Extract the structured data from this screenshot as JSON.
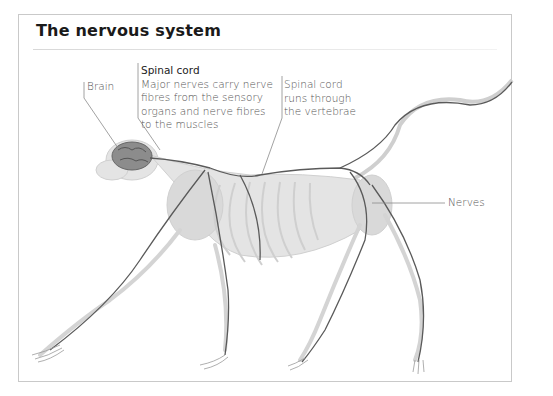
{
  "figure": {
    "title": "The nervous system",
    "labels": {
      "brain": "Brain",
      "spinal_cord_heading": "Spinal cord",
      "spinal_cord_description": [
        "Major nerves carry nerve",
        "fibres from the sensory",
        "organs and nerve fibres",
        "to the muscles"
      ],
      "vertebrae_note": [
        "Spinal cord",
        "runs through",
        "the vertebrae"
      ],
      "nerves": "Nerves"
    },
    "colors": {
      "nerve_line": "#5a5a5a",
      "skeleton": "#d6d6d6",
      "brain": "#8a8a8a",
      "frame_border": "#c9c9c9"
    }
  }
}
